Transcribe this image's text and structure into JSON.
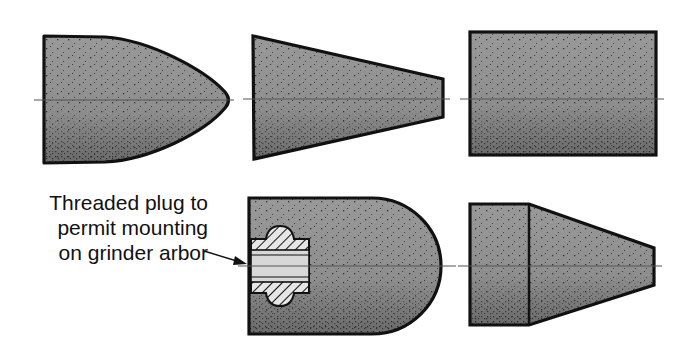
{
  "figure": {
    "annotation": {
      "lines": [
        "Threaded plug to",
        "permit mounting",
        "on grinder arbor"
      ]
    },
    "colors": {
      "fill": "#8f8f8f",
      "outline": "#111111",
      "centerline": "#555555",
      "plug_fill": "#d6d6d6",
      "background": "#ffffff"
    },
    "shapes": [
      {
        "id": "bullet-point",
        "row": 1,
        "col": 1
      },
      {
        "id": "tapered-cone",
        "row": 1,
        "col": 2
      },
      {
        "id": "cylinder",
        "row": 1,
        "col": 3
      },
      {
        "id": "round-end-with-threaded-plug",
        "row": 2,
        "col": 2
      },
      {
        "id": "cylinder-with-taper",
        "row": 2,
        "col": 3
      }
    ]
  }
}
